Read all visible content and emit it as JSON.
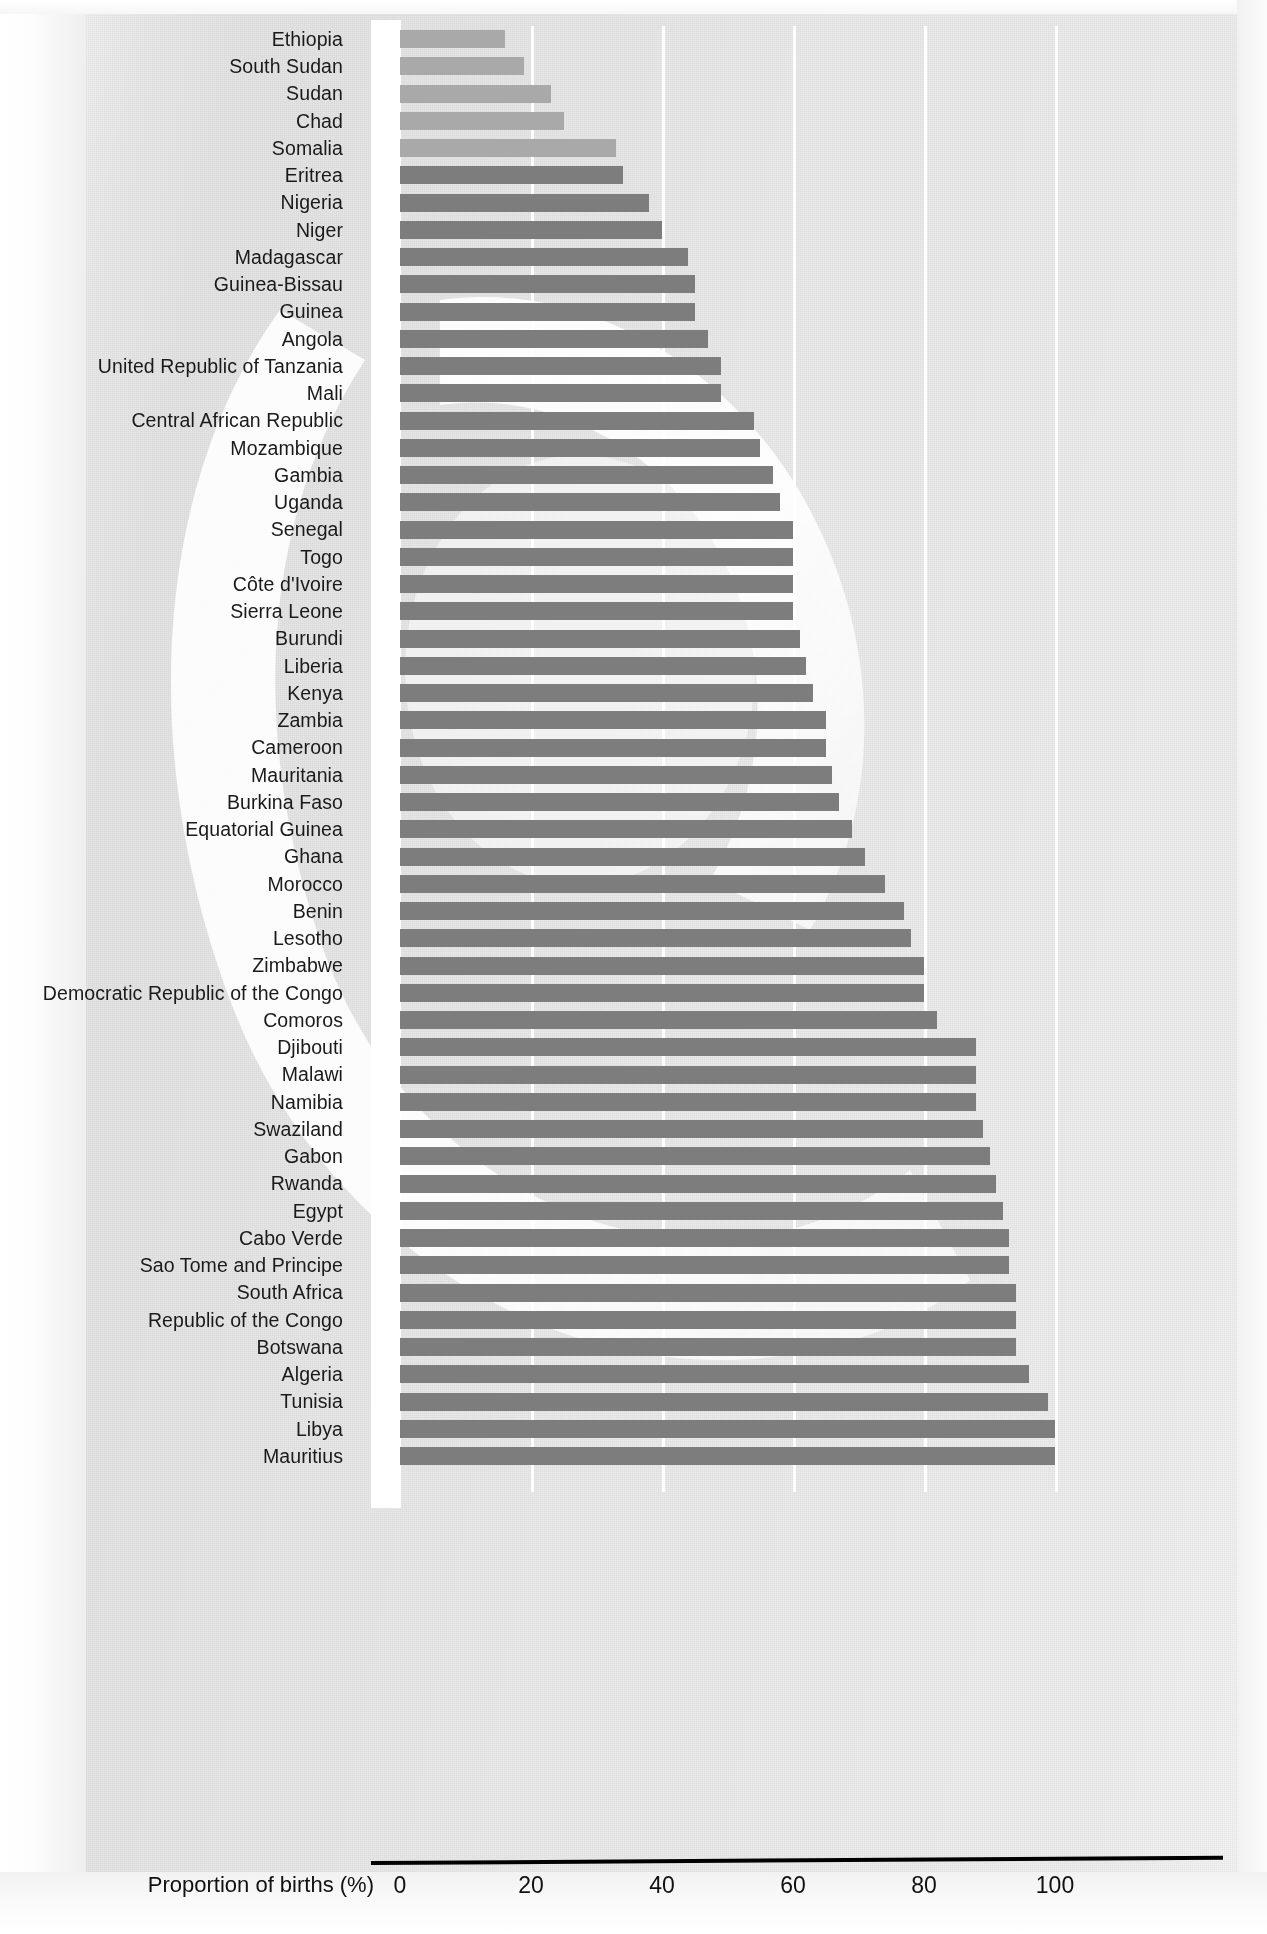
{
  "chart_data": {
    "type": "bar",
    "orientation": "horizontal",
    "title": "",
    "xlabel": "Proportion of births (%)",
    "ylabel": "",
    "xlim": [
      0,
      100
    ],
    "xticks": [
      0,
      20,
      40,
      60,
      80,
      100
    ],
    "xticklabels": [
      "0",
      "20",
      "40",
      "60",
      "80",
      "100"
    ],
    "grid": "vertical-white-gridlines",
    "legend": "none",
    "bar_color": "#7d7d7d",
    "bar_color_light": "#a9a9a9",
    "categories": [
      "Ethiopia",
      "South Sudan",
      "Sudan",
      "Chad",
      "Somalia",
      "Eritrea",
      "Nigeria",
      "Niger",
      "Madagascar",
      "Guinea-Bissau",
      "Guinea",
      "Angola",
      "United Republic of Tanzania",
      "Mali",
      "Central African Republic",
      "Mozambique",
      "Gambia",
      "Uganda",
      "Senegal",
      "Togo",
      "Côte d'Ivoire",
      "Sierra Leone",
      "Burundi",
      "Liberia",
      "Kenya",
      "Zambia",
      "Cameroon",
      "Mauritania",
      "Burkina Faso",
      "Equatorial Guinea",
      "Ghana",
      "Morocco",
      "Benin",
      "Lesotho",
      "Zimbabwe",
      "Democratic Republic of the Congo",
      "Comoros",
      "Djibouti",
      "Malawi",
      "Namibia",
      "Swaziland",
      "Gabon",
      "Rwanda",
      "Egypt",
      "Cabo Verde",
      "Sao Tome and Principe",
      "South Africa",
      "Republic of the Congo",
      "Botswana",
      "Algeria",
      "Tunisia",
      "Libya",
      "Mauritius"
    ],
    "values": [
      16,
      19,
      23,
      25,
      33,
      34,
      38,
      40,
      44,
      45,
      45,
      47,
      49,
      49,
      54,
      55,
      57,
      58,
      60,
      60,
      60,
      60,
      61,
      62,
      63,
      65,
      65,
      66,
      67,
      69,
      71,
      74,
      77,
      78,
      80,
      80,
      82,
      88,
      88,
      88,
      89,
      90,
      91,
      92,
      93,
      93,
      94,
      94,
      94,
      96,
      99,
      100,
      100
    ],
    "highlight_light_indices": [
      0,
      1,
      2,
      3,
      4
    ],
    "note": "Lighter-shaded bars are the five lowest-coverage countries"
  }
}
